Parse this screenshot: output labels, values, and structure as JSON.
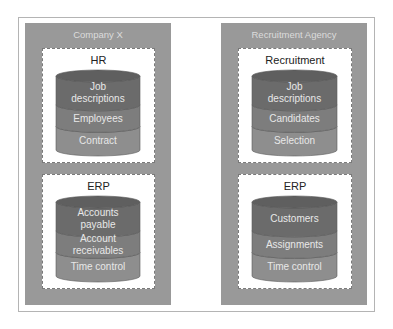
{
  "colors": {
    "org_panel": "#999999",
    "band_dark": "#6b6b6b",
    "band_mid": "#7d7d7d",
    "band_light": "#8e8e8e",
    "band_label": "#e8e8e8"
  },
  "organizations": [
    {
      "title": "Company X",
      "systems": [
        {
          "title": "HR",
          "bands": [
            "Job\ndescriptions",
            "Employees",
            "Contract"
          ]
        },
        {
          "title": "ERP",
          "bands": [
            "Accounts\npayable",
            "Account\nreceivables",
            "Time control"
          ]
        }
      ]
    },
    {
      "title": "Recruitment Agency",
      "systems": [
        {
          "title": "Recruitment",
          "bands": [
            "Job\ndescriptions",
            "Candidates",
            "Selection"
          ]
        },
        {
          "title": "ERP",
          "bands": [
            "Customers",
            "Assignments",
            "Time control"
          ]
        }
      ]
    }
  ]
}
